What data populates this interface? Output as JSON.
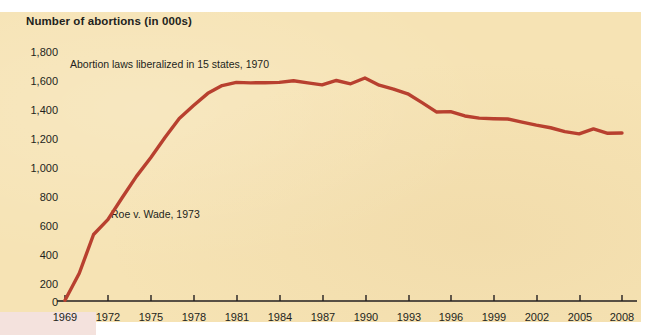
{
  "figure": {
    "background_color": "#f6e3b4",
    "page_color": "#ffffff",
    "line_color": "#b8402f",
    "axis_color": "#231f20",
    "text_color": "#231f20"
  },
  "title": "Number of abortions (in 000s)",
  "annotations": {
    "liberalization": "Abortion laws liberalized in 15 states, 1970",
    "roe_v_wade": "Roe v. Wade, 1973"
  },
  "axes": {
    "y_label": "Number of abortions (in 000s)",
    "y_ticks": [
      "1,800",
      "1,600",
      "1,400",
      "1,200",
      "1,000",
      "800",
      "600",
      "400",
      "200",
      "0"
    ],
    "x_ticks": [
      "1969",
      "1972",
      "1975",
      "1978",
      "1981",
      "1984",
      "1987",
      "1990",
      "1993",
      "1996",
      "1999",
      "2002",
      "2005",
      "2008"
    ]
  },
  "chart_data": {
    "type": "line",
    "title": "Number of abortions (in 000s)",
    "xlabel": "",
    "ylabel": "Number of abortions (in 000s)",
    "xlim": [
      1969,
      2008
    ],
    "ylim": [
      0,
      1800
    ],
    "grid": false,
    "legend": "none",
    "x_tick_values": [
      1969,
      1972,
      1975,
      1978,
      1981,
      1984,
      1987,
      1990,
      1993,
      1996,
      1999,
      2002,
      2005,
      2008
    ],
    "y_tick_values": [
      0,
      200,
      400,
      600,
      800,
      1000,
      1200,
      1400,
      1600,
      1800
    ],
    "annotations": [
      {
        "text": "Abortion laws liberalized in 15 states, 1970",
        "x": 1970,
        "y": 1760
      },
      {
        "text": "Roe v. Wade, 1973",
        "x": 1973,
        "y": 620
      }
    ],
    "series": [
      {
        "name": "Number of abortions (in 000s)",
        "color": "#b8402f",
        "x": [
          1969,
          1970,
          1971,
          1972,
          1973,
          1974,
          1975,
          1976,
          1977,
          1978,
          1979,
          1980,
          1981,
          1982,
          1983,
          1984,
          1985,
          1986,
          1987,
          1988,
          1989,
          1990,
          1991,
          1992,
          1993,
          1994,
          1995,
          1996,
          1997,
          1998,
          1999,
          2000,
          2001,
          2002,
          2003,
          2004,
          2005,
          2006,
          2007,
          2008
        ],
        "values": [
          5,
          200,
          480,
          587,
          745,
          899,
          1034,
          1179,
          1317,
          1410,
          1498,
          1554,
          1577,
          1574,
          1575,
          1577,
          1589,
          1574,
          1559,
          1591,
          1567,
          1609,
          1557,
          1529,
          1495,
          1431,
          1364,
          1366,
          1335,
          1319,
          1315,
          1313,
          1291,
          1269,
          1250,
          1222,
          1206,
          1242,
          1210,
          1212
        ]
      }
    ]
  }
}
